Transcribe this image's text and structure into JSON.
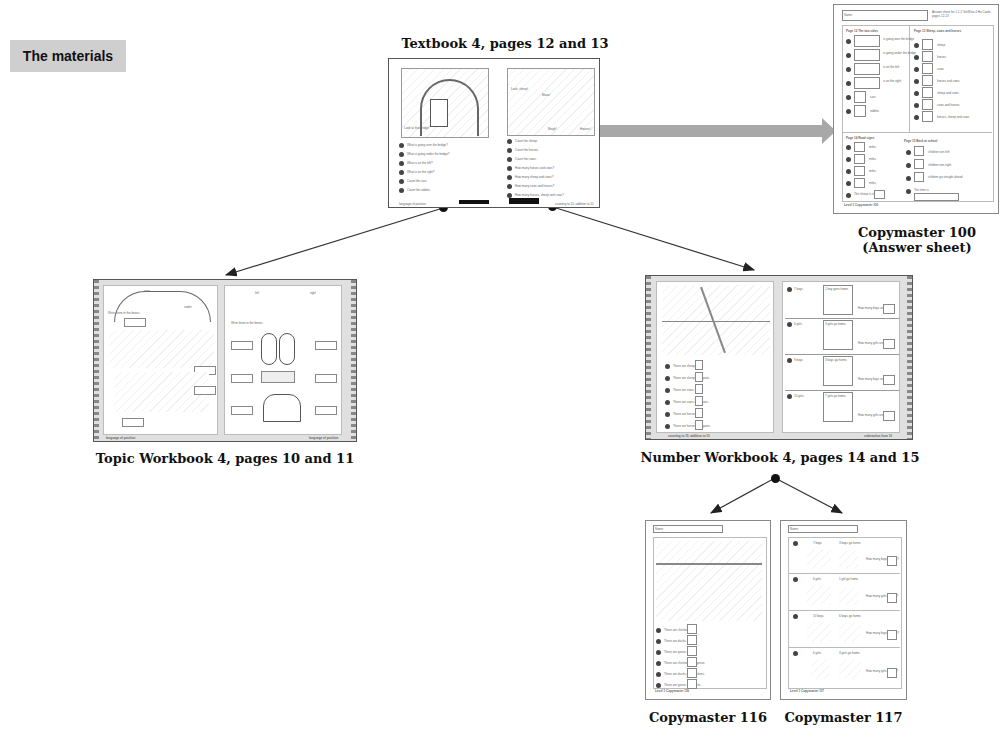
{
  "section": {
    "title": "The materials"
  },
  "materials": {
    "textbook": {
      "caption": "Textbook 4, pages 12 and 13",
      "left_footer": "language of position",
      "right_footer": "counting to 10, addition to 10",
      "left_questions": [
        "What is going over the bridge?",
        "What is going under the bridge?",
        "What is on the left?",
        "What is on the right?",
        "Count the cars.",
        "Count the rabbits."
      ],
      "right_questions": [
        "Count the sheep.",
        "Count the horses.",
        "Count the cows.",
        "How many horses and cows?",
        "How many sheep and cows?",
        "How many cows and horses?",
        "How many horses, sheep and cows?"
      ],
      "left_labels": [
        "Look at that bridge!",
        "Rabbit",
        "Bunnys"
      ],
      "right_labels": [
        "Look, sheep!",
        "Mooo!",
        "Neigh!",
        "Hooves!"
      ]
    },
    "copymaster_100": {
      "caption_line1": "Copymaster 100",
      "caption_line2": "(Answer sheet)",
      "name_label": "Name:",
      "header_note": "Answer sheet for 1.1-2 Go/Wise 4 Ho Cards pages 12-13",
      "sections": [
        {
          "title": "Page 12  The two sides",
          "items": [
            "is going over the bridge",
            "is going under the bridge",
            "is on the left",
            "is on the right",
            "cars",
            "rabbits"
          ]
        },
        {
          "title": "Page 13  Sheep, cows and horses",
          "items": [
            "sheep",
            "horses",
            "cows",
            "horses and cows",
            "sheep and cows",
            "cows and horses",
            "horses, sheep and cows"
          ]
        },
        {
          "title": "Page 14  Road signs",
          "items": [
            "miles",
            "miles",
            "miles",
            "miles",
            "The sheep is in"
          ]
        },
        {
          "title": "Page 15  Back at school",
          "items": [
            "children turn left",
            "children turn right",
            "children go straight ahead",
            "The time is"
          ]
        }
      ],
      "footer": "Level 1  Copymaster 100"
    },
    "topic_workbook": {
      "caption": "Topic Workbook 4, pages 10 and 11",
      "left_top_labels": [
        "over",
        "under"
      ],
      "right_top_labels": [
        "left",
        "right"
      ],
      "instruction": "Write them in the boxes.",
      "left_footer": "language of position",
      "right_footer": "language of position"
    },
    "number_workbook": {
      "caption": "Number Workbook 4, pages 14 and 15",
      "left_rows": [
        "There are sheep.",
        "There are sheep and goats.",
        "There are cows.",
        "There are cows and goats.",
        "There are horses.",
        "There are horses and goats."
      ],
      "right_rows": [
        {
          "start": "7 boys",
          "event": "1 boy goes home.",
          "question": "How many boys are left?"
        },
        {
          "start": "6 girls",
          "event": "3 girls go home.",
          "question": "How many girls are left?"
        },
        {
          "start": "9 boys",
          "event": "3 boys go home.",
          "question": "How many boys are left?"
        },
        {
          "start": "10 girls",
          "event": "7 girls go home.",
          "question": "How many girls are left?"
        }
      ],
      "left_footer": "counting to 10, addition to 10",
      "right_footer": "subtraction from 10"
    },
    "copymaster_116": {
      "caption": "Copymaster 116",
      "name_label": "Name:",
      "rows": [
        "There are chickens.",
        "There are ducks.",
        "There are geese.",
        "There are chickens and geese.",
        "There are ducks and chickens.",
        "There are geese and ducks."
      ],
      "footer": "Level 1  Copymaster 116"
    },
    "copymaster_117": {
      "caption": "Copymaster 117",
      "name_label": "Name:",
      "rows": [
        {
          "start": "7 boys",
          "event": "3 boys go home.",
          "question": "How many boys are left?"
        },
        {
          "start": "6 girls",
          "event": "1 girl go home.",
          "question": "How many girls are left?"
        },
        {
          "start": "10 boys",
          "event": "6 boys go home.",
          "question": "How many boys are left?"
        },
        {
          "start": "6 girls",
          "event": "3 girls go home.",
          "question": "How many girls are left?"
        }
      ],
      "footer": "Level 1  Copymaster 117"
    }
  },
  "colors": {
    "label_bg": "#cfcfcf",
    "arrow_gray": "#a8a8a8",
    "connector": "#333333",
    "spread_bg": "#e0e0e0"
  }
}
